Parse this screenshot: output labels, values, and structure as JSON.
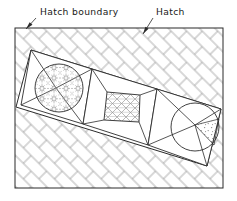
{
  "figure": {
    "background_color": "#ffffff",
    "line_color": "#2b2b2b",
    "hatch_color": "#8c8c8c",
    "fill_color": "#ffffff"
  },
  "labels": {
    "boundary": {
      "text": "Hatch boundary",
      "name": "hatch-boundary-label",
      "x": 40,
      "y": 15,
      "leader_from_x": 36,
      "leader_from_y": 18,
      "leader_to_x": 26,
      "leader_to_y": 29
    },
    "hatch": {
      "text": "Hatch",
      "name": "hatch-label",
      "x": 156,
      "y": 15,
      "leader_from_x": 153,
      "leader_from_y": 18,
      "leader_to_x": 143,
      "leader_to_y": 34
    }
  },
  "boundary_rect": {
    "name": "hatch-boundary-rectangle",
    "x": 15,
    "y": 28,
    "width": 208,
    "height": 160
  },
  "inner_region": {
    "name": "unhatched-island-region",
    "points": "31,50 221,109 207,166 16,107"
  },
  "panels": [
    {
      "name": "left-panel",
      "outline": "31,50 92,69 83,124 21,105",
      "divider_a": "31,50 56,88",
      "divider_b": "92,69 56,88",
      "divider_c": "21,105 56,88",
      "divider_d": "83,124 56,88"
    },
    {
      "name": "center-panel",
      "outline": "92,69 157,89 148,145 83,124",
      "divider_a": "92,69 107,92",
      "divider_b": "157,89 140,95",
      "divider_c": "83,124 104,120",
      "divider_d": "148,145 139,122"
    },
    {
      "name": "right-panel",
      "outline": "157,89 221,109 207,166 148,145",
      "divider_a": "157,89 195,125",
      "divider_b": "221,109 195,125",
      "divider_c": "148,145 195,125",
      "divider_d": "207,166 195,125"
    }
  ],
  "shapes": {
    "left_circle": {
      "name": "left-hatched-circle",
      "cx": 59,
      "cy": 88,
      "r": 24,
      "pattern": "honeycomb-star-hatch"
    },
    "center_square": {
      "name": "center-hatched-square",
      "points": "107,92 140,95 139,122 104,120",
      "pattern": "diagonal-crosshatch"
    },
    "right_circle": {
      "name": "right-circle",
      "cx": 195,
      "cy": 127,
      "r": 24,
      "pattern": "stipple-dots",
      "wedge": "195,125 219,119 214,145"
    }
  },
  "background_pattern": {
    "name": "diagonal-brick-hatch",
    "type": "brick-45-degree",
    "spacing": 11,
    "stroke_width": 0.65
  }
}
